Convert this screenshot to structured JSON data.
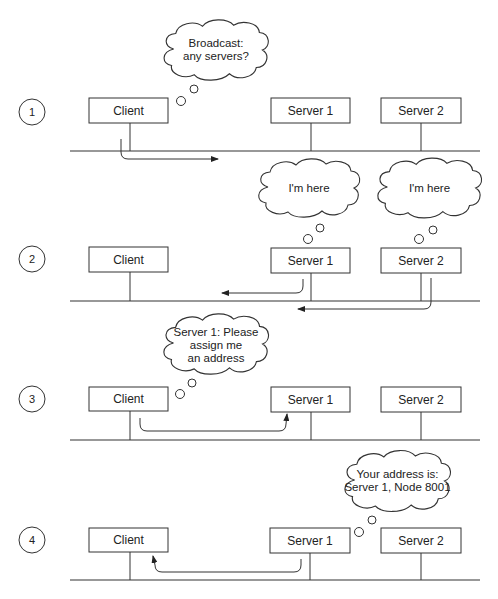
{
  "diagram": {
    "title": "",
    "nodes": {
      "client": "Client",
      "server1": "Server 1",
      "server2": "Server 2"
    },
    "steps": [
      {
        "number": "1",
        "bubble_from": "Client",
        "bubble_lines": [
          "Broadcast:",
          "any servers?"
        ],
        "arrow": "Client broadcasts onto network (rightward)"
      },
      {
        "number": "2",
        "bubble_from": "Server 1, Server 2",
        "bubble_lines": [
          "I'm here"
        ],
        "bubble_lines_server2": [
          "I'm here"
        ],
        "arrow": "Server 1 and Server 2 reply toward Client (leftward)"
      },
      {
        "number": "3",
        "bubble_from": "Client",
        "bubble_lines": [
          "Server 1: Please",
          "assign me",
          "an address"
        ],
        "arrow": "Client to Server 1"
      },
      {
        "number": "4",
        "bubble_from": "Server 1",
        "bubble_lines": [
          "Your address is:",
          "Server 1, Node 8001"
        ],
        "arrow": "Server 1 to Client"
      }
    ],
    "colors": {
      "line": "#333333",
      "background": "#ffffff"
    }
  }
}
